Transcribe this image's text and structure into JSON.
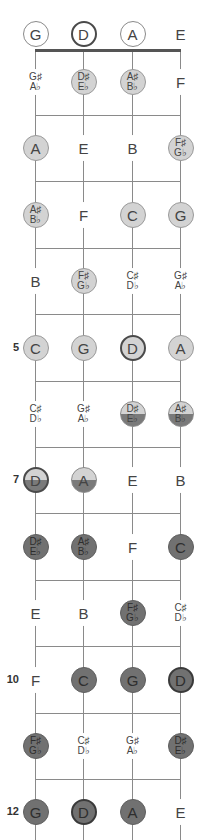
{
  "diagram": {
    "type": "fretboard",
    "instrument_tuning": [
      "G",
      "D",
      "A",
      "E"
    ],
    "colors": {
      "light_fill": "#d3d3d3",
      "dark_fill": "#717171",
      "line": "#8a8a8a",
      "nut": "#555555",
      "bold_border": "#4a4a4a"
    },
    "fret_markers": [
      {
        "fret": 5,
        "label": "5"
      },
      {
        "fret": 7,
        "label": "7"
      },
      {
        "fret": 10,
        "label": "10"
      },
      {
        "fret": 12,
        "label": "12"
      }
    ],
    "rows": [
      {
        "fret": 0,
        "notes": [
          {
            "lines": [
              "G"
            ],
            "style": "outline"
          },
          {
            "lines": [
              "D"
            ],
            "style": "outline-bold"
          },
          {
            "lines": [
              "A"
            ],
            "style": "outline"
          },
          {
            "lines": [
              "E"
            ],
            "style": "plain"
          }
        ]
      },
      {
        "fret": 1,
        "notes": [
          {
            "lines": [
              "G♯",
              "A♭"
            ],
            "style": "plain"
          },
          {
            "lines": [
              "D♯",
              "E♭"
            ],
            "style": "light"
          },
          {
            "lines": [
              "A♯",
              "B♭"
            ],
            "style": "light"
          },
          {
            "lines": [
              "F"
            ],
            "style": "plain"
          }
        ]
      },
      {
        "fret": 2,
        "notes": [
          {
            "lines": [
              "A"
            ],
            "style": "light"
          },
          {
            "lines": [
              "E"
            ],
            "style": "plain"
          },
          {
            "lines": [
              "B"
            ],
            "style": "plain"
          },
          {
            "lines": [
              "F♯",
              "G♭"
            ],
            "style": "light"
          }
        ]
      },
      {
        "fret": 3,
        "notes": [
          {
            "lines": [
              "A♯",
              "B♭"
            ],
            "style": "light"
          },
          {
            "lines": [
              "F"
            ],
            "style": "plain"
          },
          {
            "lines": [
              "C"
            ],
            "style": "light"
          },
          {
            "lines": [
              "G"
            ],
            "style": "light"
          }
        ]
      },
      {
        "fret": 4,
        "notes": [
          {
            "lines": [
              "B"
            ],
            "style": "plain"
          },
          {
            "lines": [
              "F♯",
              "G♭"
            ],
            "style": "light"
          },
          {
            "lines": [
              "C♯",
              "D♭"
            ],
            "style": "plain"
          },
          {
            "lines": [
              "G♯",
              "A♭"
            ],
            "style": "plain"
          }
        ]
      },
      {
        "fret": 5,
        "notes": [
          {
            "lines": [
              "C"
            ],
            "style": "light"
          },
          {
            "lines": [
              "G"
            ],
            "style": "light"
          },
          {
            "lines": [
              "D"
            ],
            "style": "light-bold"
          },
          {
            "lines": [
              "A"
            ],
            "style": "light"
          }
        ]
      },
      {
        "fret": 6,
        "notes": [
          {
            "lines": [
              "C♯",
              "D♭"
            ],
            "style": "plain"
          },
          {
            "lines": [
              "G♯",
              "A♭"
            ],
            "style": "plain"
          },
          {
            "lines": [
              "D♯",
              "E♭"
            ],
            "style": "split"
          },
          {
            "lines": [
              "A♯",
              "B♭"
            ],
            "style": "split"
          }
        ]
      },
      {
        "fret": 7,
        "notes": [
          {
            "lines": [
              "D"
            ],
            "style": "split-bold"
          },
          {
            "lines": [
              "A"
            ],
            "style": "split"
          },
          {
            "lines": [
              "E"
            ],
            "style": "plain"
          },
          {
            "lines": [
              "B"
            ],
            "style": "plain"
          }
        ]
      },
      {
        "fret": 8,
        "notes": [
          {
            "lines": [
              "D♯",
              "E♭"
            ],
            "style": "dark"
          },
          {
            "lines": [
              "A♯",
              "B♭"
            ],
            "style": "dark"
          },
          {
            "lines": [
              "F"
            ],
            "style": "plain"
          },
          {
            "lines": [
              "C"
            ],
            "style": "dark"
          }
        ]
      },
      {
        "fret": 9,
        "notes": [
          {
            "lines": [
              "E"
            ],
            "style": "plain"
          },
          {
            "lines": [
              "B"
            ],
            "style": "plain"
          },
          {
            "lines": [
              "F♯",
              "G♭"
            ],
            "style": "dark"
          },
          {
            "lines": [
              "C♯",
              "D♭"
            ],
            "style": "plain"
          }
        ]
      },
      {
        "fret": 10,
        "notes": [
          {
            "lines": [
              "F"
            ],
            "style": "plain"
          },
          {
            "lines": [
              "C"
            ],
            "style": "dark"
          },
          {
            "lines": [
              "G"
            ],
            "style": "dark"
          },
          {
            "lines": [
              "D"
            ],
            "style": "dark-bold"
          }
        ]
      },
      {
        "fret": 11,
        "notes": [
          {
            "lines": [
              "F♯",
              "G♭"
            ],
            "style": "dark"
          },
          {
            "lines": [
              "C♯",
              "D♭"
            ],
            "style": "plain"
          },
          {
            "lines": [
              "G♯",
              "A♭"
            ],
            "style": "plain"
          },
          {
            "lines": [
              "D♯",
              "E♭"
            ],
            "style": "dark"
          }
        ]
      },
      {
        "fret": 12,
        "notes": [
          {
            "lines": [
              "G"
            ],
            "style": "dark"
          },
          {
            "lines": [
              "D"
            ],
            "style": "dark-bold"
          },
          {
            "lines": [
              "A"
            ],
            "style": "dark"
          },
          {
            "lines": [
              "E"
            ],
            "style": "plain"
          }
        ]
      }
    ]
  }
}
